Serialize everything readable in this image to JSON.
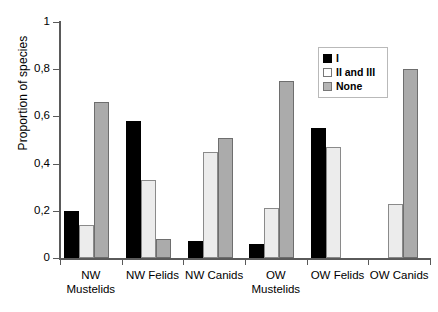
{
  "chart_data": {
    "type": "bar",
    "title": "",
    "xlabel": "",
    "ylabel": "Proportion of species",
    "ylim": [
      0,
      1
    ],
    "ytick_labels": [
      "0",
      "0,2",
      "0,4",
      "0,6",
      "0,8",
      "1"
    ],
    "ytick_values": [
      0,
      0.2,
      0.4,
      0.6,
      0.8,
      1
    ],
    "grid": false,
    "legend_position": "top-right",
    "categories": [
      "NW Mustelids",
      "NW Felids",
      "NW Canids",
      "OW Mustelids",
      "OW Felids",
      "OW Canids"
    ],
    "category_lines": [
      [
        "NW",
        "Mustelids"
      ],
      [
        "NW Felids",
        ""
      ],
      [
        "NW Canids",
        ""
      ],
      [
        "OW",
        "Mustelids"
      ],
      [
        "OW Felids",
        ""
      ],
      [
        "OW Canids",
        ""
      ]
    ],
    "series": [
      {
        "name": "I",
        "color": "#000000",
        "values": [
          0.2,
          0.58,
          0.07,
          0.06,
          0.55,
          0.0
        ]
      },
      {
        "name": "II and III",
        "color": "#ececec",
        "values": [
          0.14,
          0.33,
          0.45,
          0.21,
          0.47,
          0.23
        ]
      },
      {
        "name": "None",
        "color": "#ababab",
        "values": [
          0.66,
          0.08,
          0.51,
          0.75,
          0.0,
          0.8
        ]
      }
    ]
  },
  "legend": {
    "entries": [
      {
        "label": "I"
      },
      {
        "label": "II and III"
      },
      {
        "label": "None"
      }
    ]
  }
}
